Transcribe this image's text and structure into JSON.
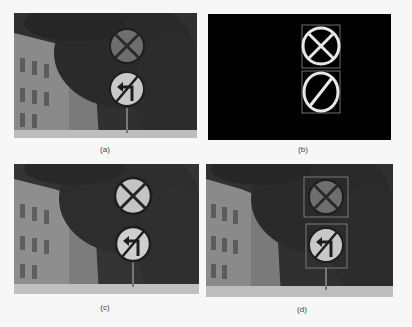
{
  "figure": {
    "panels": [
      {
        "id": "a",
        "caption": "(a)",
        "description": "Original street scene photo with two circular traffic signs"
      },
      {
        "id": "b",
        "caption": "(b)",
        "description": "Binary detection mask with two sign outlines in bounding boxes"
      },
      {
        "id": "c",
        "caption": "(c)",
        "description": "Enhanced photo with brightened sign regions"
      },
      {
        "id": "d",
        "caption": "(d)",
        "description": "Photo with detected signs framed by bounding boxes"
      }
    ],
    "signs": [
      {
        "name": "no-stopping-sign",
        "glyph": "cross"
      },
      {
        "name": "no-left-turn-sign",
        "glyph": "left-turn-arrow-with-slash"
      }
    ],
    "colors": {
      "page_background": "#f7f7f7",
      "foliage": "#2e2e2e",
      "building": "#8a8a8a",
      "sign_face_a": "#6e6e6e",
      "sign_face_light": "#c8c8c8",
      "mask_background": "#000000",
      "mask_outline": "#e8e8e8",
      "bbox": "#8c8c8c"
    }
  }
}
